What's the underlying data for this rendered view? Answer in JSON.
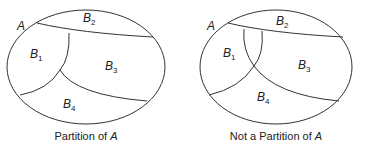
{
  "figures": [
    {
      "id": "partition",
      "set_label": "A",
      "regions": [
        {
          "base": "B",
          "sub": "1"
        },
        {
          "base": "B",
          "sub": "2"
        },
        {
          "base": "B",
          "sub": "3"
        },
        {
          "base": "B",
          "sub": "4"
        }
      ],
      "caption_text": "Partition of ",
      "caption_var": "A"
    },
    {
      "id": "not-partition",
      "set_label": "A",
      "regions": [
        {
          "base": "B",
          "sub": "1"
        },
        {
          "base": "B",
          "sub": "2"
        },
        {
          "base": "B",
          "sub": "3"
        },
        {
          "base": "B",
          "sub": "4"
        }
      ],
      "caption_text": "Not a Partition of ",
      "caption_var": "A"
    }
  ],
  "colors": {
    "stroke": "#333333",
    "text": "#222222",
    "background": "#ffffff"
  }
}
